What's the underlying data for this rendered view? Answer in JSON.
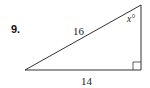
{
  "problem": {
    "number": "9.",
    "figure": "right-triangle",
    "hypotenuse_label": "16",
    "base_label": "14",
    "angle_label": "x°",
    "right_angle_position": "bottom-right",
    "stroke_color": "#333333"
  }
}
